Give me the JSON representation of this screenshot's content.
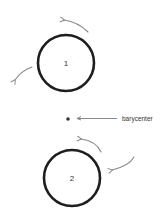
{
  "diagram": {
    "bodies": [
      {
        "id": "body-1",
        "label": "1",
        "cx": 66,
        "cy": 63,
        "r": 28
      },
      {
        "id": "body-2",
        "label": "2",
        "cx": 72,
        "cy": 178,
        "r": 28
      }
    ],
    "barycenter": {
      "label": "barycenter",
      "x": 68,
      "y": 119
    },
    "colors": {
      "circle": "#1e1e1e",
      "arrow": "#8a8a8a",
      "text": "#333333",
      "background": "#ffffff"
    }
  }
}
